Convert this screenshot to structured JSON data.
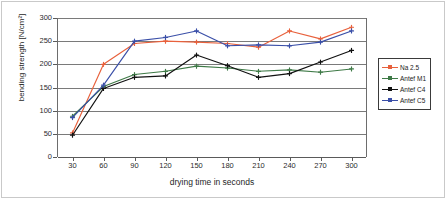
{
  "chart_data": {
    "type": "line",
    "title": "",
    "xlabel": "drying time in seconds",
    "ylabel": "bending strength [N/cm²]",
    "xlim": [
      15,
      315
    ],
    "ylim": [
      0,
      300
    ],
    "x": [
      30,
      60,
      90,
      120,
      150,
      180,
      210,
      240,
      270,
      300
    ],
    "xticks": [
      "30",
      "60",
      "90",
      "120",
      "150",
      "180",
      "210",
      "240",
      "270",
      "300"
    ],
    "yticks": [
      "0",
      "50",
      "100",
      "150",
      "200",
      "250",
      "300"
    ],
    "grid": "horizontal",
    "legend_position": "right-outside",
    "series": [
      {
        "name": "Na 2.5",
        "color": "#e8613c",
        "marker": "plus",
        "values": [
          52,
          200,
          245,
          250,
          248,
          245,
          237,
          272,
          255,
          280
        ]
      },
      {
        "name": "Antef M1",
        "color": "#3f7a47",
        "marker": "plus",
        "values": [
          88,
          152,
          178,
          185,
          196,
          192,
          185,
          188,
          183,
          190
        ]
      },
      {
        "name": "Antef C4",
        "color": "#111111",
        "marker": "plus",
        "values": [
          47,
          148,
          172,
          175,
          220,
          197,
          172,
          180,
          205,
          230
        ]
      },
      {
        "name": "Antef C5",
        "color": "#3a4fa8",
        "marker": "plus",
        "values": [
          85,
          155,
          250,
          258,
          272,
          240,
          242,
          240,
          248,
          272
        ]
      }
    ]
  },
  "legend": {
    "items": [
      {
        "label": "Na 2.5",
        "color": "#e8613c"
      },
      {
        "label": "Antef M1",
        "color": "#3f7a47"
      },
      {
        "label": "Antef C4",
        "color": "#111111"
      },
      {
        "label": "Antef C5",
        "color": "#3a4fa8"
      }
    ]
  },
  "axes": {
    "x_title": "drying time in seconds",
    "y_title": "bending strength [N/cm²]"
  }
}
